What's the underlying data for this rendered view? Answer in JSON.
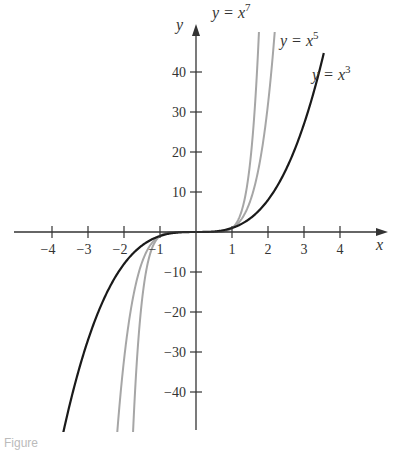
{
  "chart_data": {
    "type": "line",
    "title": "",
    "xlabel": "x",
    "ylabel": "y",
    "xlim": [
      -4.5,
      4.6
    ],
    "ylim": [
      -50,
      50
    ],
    "grid": false,
    "x_ticks": [
      -4,
      -3,
      -2,
      -1,
      1,
      2,
      3,
      4
    ],
    "x_tick_labels": [
      "−4",
      "−3",
      "−2",
      "−1",
      "1",
      "2",
      "3",
      "4"
    ],
    "y_ticks": [
      40,
      30,
      20,
      10,
      -10,
      -20,
      -30,
      -40
    ],
    "y_tick_labels": [
      "40",
      "30",
      "20",
      "10",
      "−10",
      "−20",
      "−30",
      "−40"
    ],
    "series": [
      {
        "name": "y = x^7",
        "exponent": 7,
        "color": "#a6a6a6",
        "x_range": [
          -1.75,
          1.75
        ],
        "label_text": "y = x",
        "label_sup": "7"
      },
      {
        "name": "y = x^5",
        "exponent": 5,
        "color": "#a6a6a6",
        "x_range": [
          -2.2,
          2.2
        ],
        "label_text": "y = x",
        "label_sup": "5"
      },
      {
        "name": "y = x^3",
        "exponent": 3,
        "color": "#1a1a1a",
        "x_range": [
          -3.7,
          3.55
        ],
        "label_text": "y = x",
        "label_sup": "3"
      }
    ],
    "legend_position": "inline labels near top-right of each curve"
  },
  "caption": "Figure"
}
